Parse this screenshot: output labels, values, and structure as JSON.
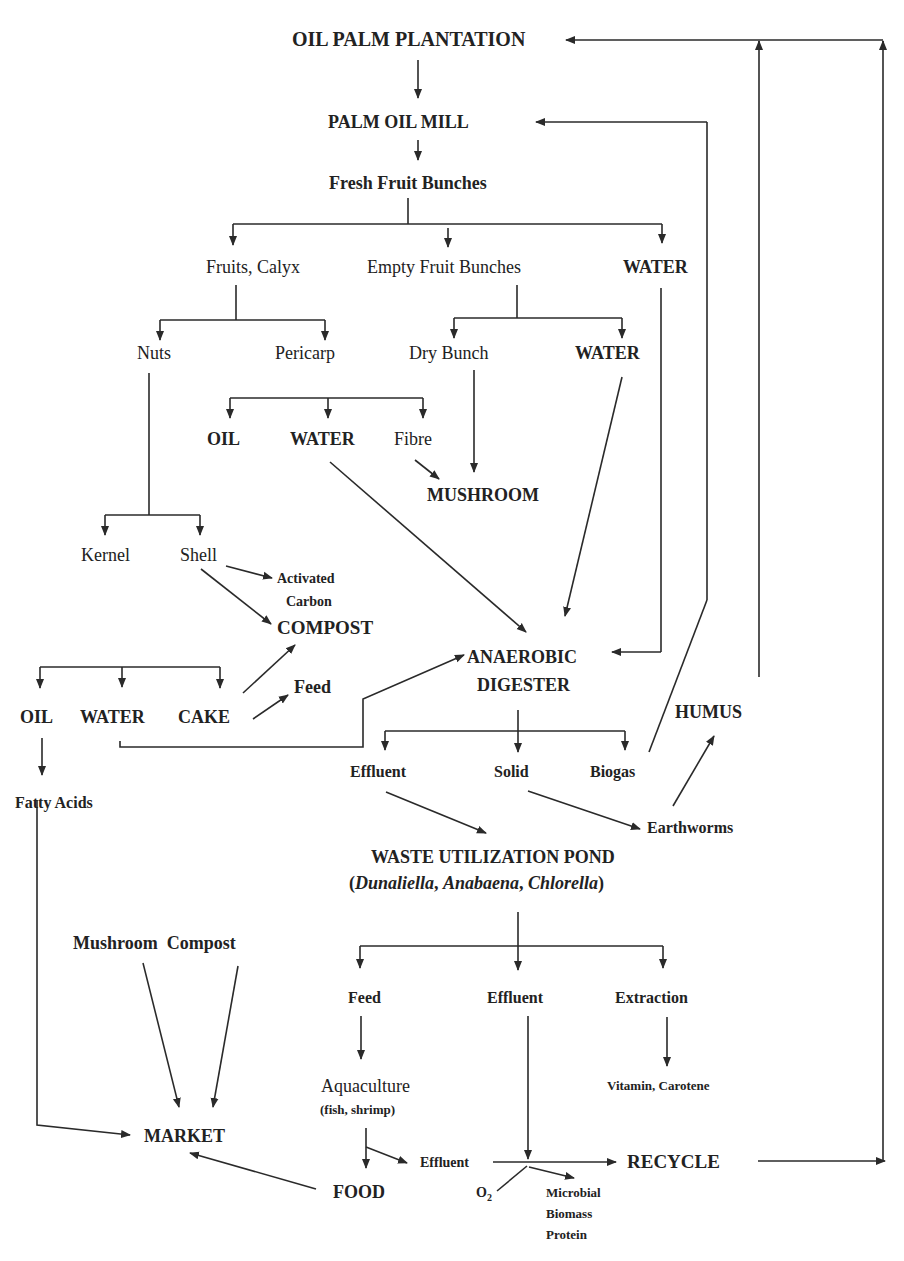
{
  "diagram": {
    "type": "flowchart",
    "colors": {
      "line": "#2a2a2a",
      "text": "#222222",
      "background": "#ffffff"
    },
    "nodes": {
      "plantation": "OIL PALM PLANTATION",
      "mill": "PALM OIL MILL",
      "ffb": "Fresh Fruit Bunches",
      "fruits_calyx": "Fruits, Calyx",
      "efb": "Empty Fruit Bunches",
      "water_top": "WATER",
      "nuts": "Nuts",
      "pericarp": "Pericarp",
      "dry_bunch": "Dry Bunch",
      "water_efb": "WATER",
      "oil_pericarp": "OIL",
      "water_pericarp": "WATER",
      "fibre": "Fibre",
      "mushroom": "MUSHROOM",
      "kernel": "Kernel",
      "shell": "Shell",
      "activated": "Activated",
      "carbon": "Carbon",
      "compost": "COMPOST",
      "oil_kernel": "OIL",
      "water_kernel": "WATER",
      "cake": "CAKE",
      "feed_cake": "Feed",
      "anaerobic": "ANAEROBIC",
      "digester": "DIGESTER",
      "humus": "HUMUS",
      "fatty_acids": "Fatty Acids",
      "effluent_digester": "Effluent",
      "solid": "Solid",
      "biogas": "Biogas",
      "earthworms": "Earthworms",
      "pond": "WASTE UTILIZATION POND",
      "pond_open": "(",
      "pond_species_1": "Dunaliella",
      "pond_comma_1": ", ",
      "pond_species_2": "Anabaena",
      "pond_comma_2": ", ",
      "pond_species_3": "Chlorella",
      "pond_close": ")",
      "mushroom_compost": "Mushroom  Compost",
      "feed_pond": "Feed",
      "effluent_pond": "Effluent",
      "extraction": "Extraction",
      "aquaculture": "Aquaculture",
      "aquaculture_sub": "(fish, shrimp)",
      "vitamin": "Vitamin, Carotene",
      "market": "MARKET",
      "effluent_aqua": "Effluent",
      "recycle": "RECYCLE",
      "food": "FOOD",
      "o2": "O",
      "o2_sub": "2",
      "microbial": "Microbial",
      "biomass": "Biomass",
      "protein": "Protein"
    },
    "edges": [
      [
        "OIL PALM PLANTATION",
        "PALM OIL MILL"
      ],
      [
        "PALM OIL MILL",
        "Fresh Fruit Bunches"
      ],
      [
        "Fresh Fruit Bunches",
        "Fruits, Calyx"
      ],
      [
        "Fresh Fruit Bunches",
        "Empty Fruit Bunches"
      ],
      [
        "Fresh Fruit Bunches",
        "WATER"
      ],
      [
        "Fruits, Calyx",
        "Nuts"
      ],
      [
        "Fruits, Calyx",
        "Pericarp"
      ],
      [
        "Empty Fruit Bunches",
        "Dry Bunch"
      ],
      [
        "Empty Fruit Bunches",
        "WATER"
      ],
      [
        "Pericarp",
        "OIL"
      ],
      [
        "Pericarp",
        "WATER"
      ],
      [
        "Pericarp",
        "Fibre"
      ],
      [
        "Fibre",
        "MUSHROOM"
      ],
      [
        "Dry Bunch",
        "MUSHROOM"
      ],
      [
        "Nuts",
        "Kernel"
      ],
      [
        "Nuts",
        "Shell"
      ],
      [
        "Shell",
        "Activated Carbon"
      ],
      [
        "Shell",
        "COMPOST"
      ],
      [
        "Kernel",
        "OIL"
      ],
      [
        "Kernel",
        "WATER"
      ],
      [
        "Kernel",
        "CAKE"
      ],
      [
        "CAKE",
        "COMPOST"
      ],
      [
        "CAKE",
        "Feed"
      ],
      [
        "OIL",
        "Fatty Acids"
      ],
      [
        "WATER (kernel)",
        "ANAEROBIC DIGESTER"
      ],
      [
        "WATER (pericarp)",
        "ANAEROBIC DIGESTER"
      ],
      [
        "WATER (EFB)",
        "ANAEROBIC DIGESTER"
      ],
      [
        "WATER (FFB)",
        "ANAEROBIC DIGESTER"
      ],
      [
        "ANAEROBIC DIGESTER",
        "Effluent"
      ],
      [
        "ANAEROBIC DIGESTER",
        "Solid"
      ],
      [
        "ANAEROBIC DIGESTER",
        "Biogas"
      ],
      [
        "Biogas",
        "PALM OIL MILL"
      ],
      [
        "Solid",
        "Earthworms"
      ],
      [
        "Earthworms",
        "HUMUS"
      ],
      [
        "HUMUS",
        "OIL PALM PLANTATION"
      ],
      [
        "Effluent",
        "WASTE UTILIZATION POND"
      ],
      [
        "WASTE UTILIZATION POND",
        "Feed"
      ],
      [
        "WASTE UTILIZATION POND",
        "Effluent"
      ],
      [
        "WASTE UTILIZATION POND",
        "Extraction"
      ],
      [
        "Extraction",
        "Vitamin, Carotene"
      ],
      [
        "Feed",
        "Aquaculture"
      ],
      [
        "Aquaculture",
        "FOOD"
      ],
      [
        "Aquaculture",
        "Effluent"
      ],
      [
        "Effluent (pond)",
        "RECYCLE"
      ],
      [
        "Effluent (aquaculture)",
        "RECYCLE"
      ],
      [
        "O2",
        "Microbial Biomass Protein"
      ],
      [
        "RECYCLE",
        "OIL PALM PLANTATION"
      ],
      [
        "FOOD",
        "MARKET"
      ],
      [
        "Mushroom",
        "MARKET"
      ],
      [
        "Compost",
        "MARKET"
      ],
      [
        "Fatty Acids",
        "MARKET"
      ]
    ]
  }
}
